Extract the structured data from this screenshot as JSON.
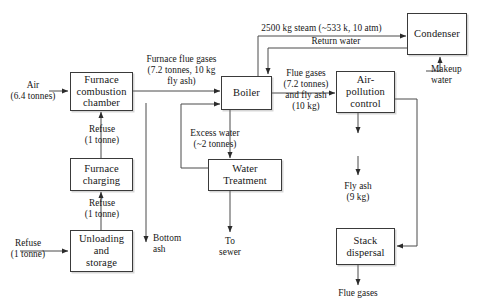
{
  "diagram": {
    "nodes": [
      {
        "id": "furnace_combustion_chamber",
        "label": "Furnace\ncombustion\nchamber"
      },
      {
        "id": "furnace_charging",
        "label": "Furnace\ncharging"
      },
      {
        "id": "unloading_and_storage",
        "label": "Unloading\nand\nstorage"
      },
      {
        "id": "boiler",
        "label": "Boiler"
      },
      {
        "id": "water_treatment",
        "label": "Water\nTreatment"
      },
      {
        "id": "air_pollution_control",
        "label": "Air-\npollution\ncontrol"
      },
      {
        "id": "condenser",
        "label": "Condenser"
      },
      {
        "id": "stack_dispersal",
        "label": "Stack\ndispersal"
      }
    ],
    "edge_labels": [
      {
        "id": "refuse_input",
        "text": "Refuse\n(1 tonne)"
      },
      {
        "id": "refuse_unloading_to_charging",
        "text": "Refuse\n(1 tonne)"
      },
      {
        "id": "refuse_charging_to_furnace",
        "text": "Refuse\n(1 tonne)"
      },
      {
        "id": "air_input",
        "text": "Air\n(6.4 tonnes)"
      },
      {
        "id": "furnace_flue_gases",
        "text": "Furnace flue gases\n(7.2 tonnes, 10 kg\nfly ash)"
      },
      {
        "id": "bottom_ash",
        "text": "Bottom\nash"
      },
      {
        "id": "excess_water",
        "text": "Excess water\n(~2 tonnes)"
      },
      {
        "id": "to_sewer",
        "text": "To\nsewer"
      },
      {
        "id": "steam",
        "text": "2500 kg steam (~533 k, 10 atm)"
      },
      {
        "id": "return_water",
        "text": "Return water"
      },
      {
        "id": "makeup_water",
        "text": "Makeup\nwater"
      },
      {
        "id": "flue_gases_and_fly_ash",
        "text": "Flue gases\n(7.2 tonnes)\nand fly ash\n(10 kg)"
      },
      {
        "id": "fly_ash_output",
        "text": "Fly ash\n(9 kg)"
      },
      {
        "id": "flue_gases_output",
        "text": "Flue gases"
      }
    ]
  }
}
